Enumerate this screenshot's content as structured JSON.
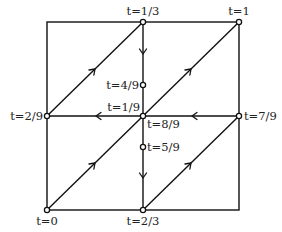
{
  "diagram": {
    "colors": {
      "stroke": "#111111",
      "background": "#ffffff",
      "text": "#222222"
    },
    "nodes": [
      {
        "id": "n0",
        "label": "t=0",
        "x": 47,
        "y": 210,
        "label_pos": "below"
      },
      {
        "id": "n2_9",
        "label": "t=2/9",
        "x": 47,
        "y": 116,
        "label_pos": "left"
      },
      {
        "id": "n1_3",
        "label": "t=1/3",
        "x": 143,
        "y": 22,
        "label_pos": "above"
      },
      {
        "id": "n4_9",
        "label": "t=4/9",
        "x": 143,
        "y": 85,
        "label_pos": "left"
      },
      {
        "id": "n1_9",
        "label": "t=1/9",
        "x": 143,
        "y": 116,
        "label_pos": "upper-left"
      },
      {
        "id": "n8_9",
        "label": "t=8/9",
        "x": 143,
        "y": 116,
        "label_pos": "lower-right"
      },
      {
        "id": "n5_9",
        "label": "t=5/9",
        "x": 143,
        "y": 147,
        "label_pos": "right"
      },
      {
        "id": "n2_3",
        "label": "t=2/3",
        "x": 143,
        "y": 210,
        "label_pos": "below"
      },
      {
        "id": "n1",
        "label": "t=1",
        "x": 239,
        "y": 22,
        "label_pos": "above"
      },
      {
        "id": "n7_9",
        "label": "t=7/9",
        "x": 239,
        "y": 116,
        "label_pos": "right"
      }
    ],
    "labels": {
      "t0": "t=0",
      "t2_9": "t=2/9",
      "t1_3": "t=1/3",
      "t4_9": "t=4/9",
      "t1_9": "t=1/9",
      "t8_9": "t=8/9",
      "t5_9": "t=5/9",
      "t2_3": "t=2/3",
      "t1": "t=1",
      "t7_9": "t=7/9"
    },
    "square": {
      "x0": 47,
      "y0": 22,
      "x1": 239,
      "y1": 210
    },
    "directed_edges": [
      {
        "from": "t=2/9",
        "to": "t=1/3",
        "direction": "up-right"
      },
      {
        "from": "t=1/3",
        "to": "t=4/9",
        "direction": "down"
      },
      {
        "from": "t=0",
        "to": "t=1",
        "direction": "up-right",
        "arrows": 2
      },
      {
        "from": "t=1/9",
        "to": "t=2/9",
        "direction": "left"
      },
      {
        "from": "t=7/9",
        "to": "t=8/9",
        "direction": "left"
      },
      {
        "from": "t=5/9",
        "to": "t=2/3",
        "direction": "down"
      },
      {
        "from": "t=2/3",
        "to": "t=7/9",
        "direction": "up-right"
      }
    ]
  }
}
